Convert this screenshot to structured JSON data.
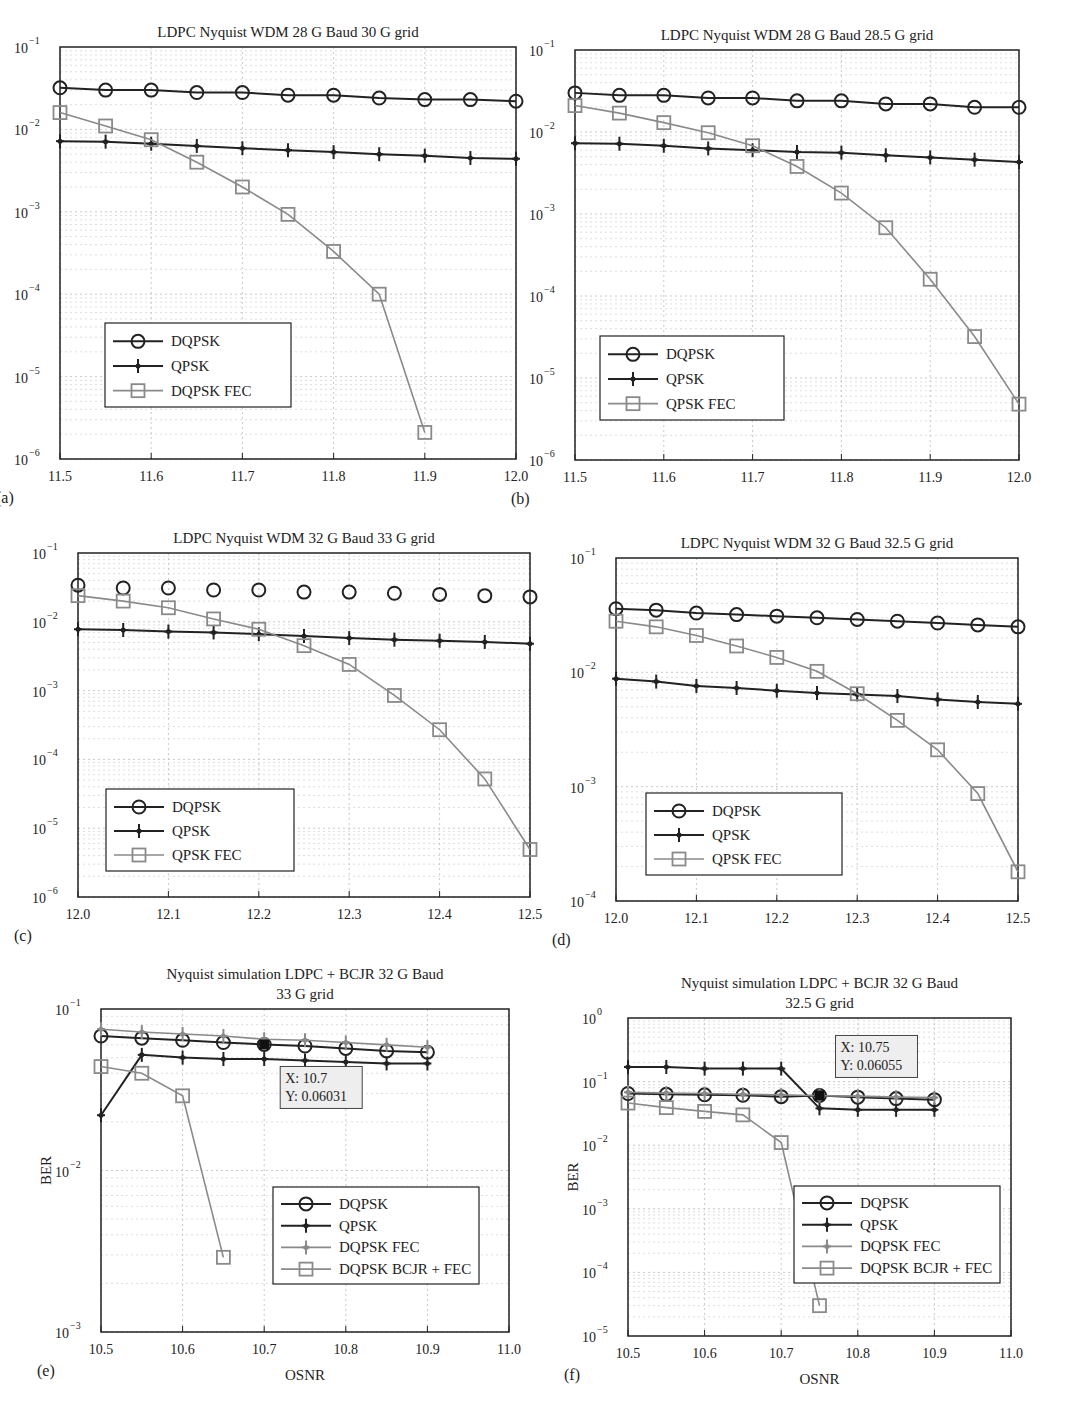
{
  "chart_data": [
    {
      "id": "a",
      "panel_label": "(a)",
      "type": "line",
      "title": "LDPC Nyquist WDM 28 G Baud 30 G grid",
      "title2": "",
      "xlabel": "",
      "ylabel": "",
      "yscale": "log",
      "xlim": [
        11.5,
        12.0
      ],
      "ylim_exp": [
        -6,
        -1
      ],
      "xticks": [
        "11.5",
        "11.6",
        "11.7",
        "11.8",
        "11.9",
        "12.0"
      ],
      "yticks": [
        {
          "base": "10",
          "exp": "−1"
        },
        {
          "base": "10",
          "exp": "−2"
        },
        {
          "base": "10",
          "exp": "−3"
        },
        {
          "base": "10",
          "exp": "−4"
        },
        {
          "base": "10",
          "exp": "−5"
        },
        {
          "base": "10",
          "exp": "−6"
        }
      ],
      "grid": true,
      "legend_position": "lower left",
      "series": [
        {
          "name": "DQPSK",
          "marker": "circle",
          "color": "#222222",
          "x": [
            11.5,
            11.55,
            11.6,
            11.65,
            11.7,
            11.75,
            11.8,
            11.85,
            11.9,
            11.95,
            12.0
          ],
          "values": [
            0.032,
            0.03,
            0.03,
            0.028,
            0.028,
            0.026,
            0.026,
            0.024,
            0.023,
            0.023,
            0.022
          ]
        },
        {
          "name": "QPSK",
          "marker": "star",
          "color": "#222222",
          "x": [
            11.5,
            11.55,
            11.6,
            11.65,
            11.7,
            11.75,
            11.8,
            11.85,
            11.9,
            11.95,
            12.0
          ],
          "values": [
            0.0072,
            0.0071,
            0.0067,
            0.0063,
            0.0059,
            0.0056,
            0.0053,
            0.005,
            0.0048,
            0.0045,
            0.0044
          ]
        },
        {
          "name": "DQPSK FEC",
          "marker": "square",
          "color": "#8a8a8a",
          "x": [
            11.5,
            11.55,
            11.6,
            11.65,
            11.7,
            11.75,
            11.8,
            11.85,
            11.9
          ],
          "values": [
            0.016,
            0.011,
            0.0075,
            0.004,
            0.002,
            0.00093,
            0.00033,
            0.0001,
            2.1e-06
          ]
        }
      ],
      "annotations": []
    },
    {
      "id": "b",
      "panel_label": "(b)",
      "type": "line",
      "title": "LDPC Nyquist WDM 28 G Baud 28.5 G grid",
      "title2": "",
      "xlabel": "",
      "ylabel": "",
      "yscale": "log",
      "xlim": [
        11.5,
        12.0
      ],
      "ylim_exp": [
        -6,
        -1
      ],
      "xticks": [
        "11.5",
        "11.6",
        "11.7",
        "11.8",
        "11.9",
        "12.0"
      ],
      "yticks": [
        {
          "base": "10",
          "exp": "−1"
        },
        {
          "base": "10",
          "exp": "−2"
        },
        {
          "base": "10",
          "exp": "−3"
        },
        {
          "base": "10",
          "exp": "−4"
        },
        {
          "base": "10",
          "exp": "−5"
        },
        {
          "base": "10",
          "exp": "−6"
        }
      ],
      "grid": true,
      "legend_position": "lower left",
      "series": [
        {
          "name": "DQPSK",
          "marker": "circle",
          "color": "#222222",
          "x": [
            11.5,
            11.55,
            11.6,
            11.65,
            11.7,
            11.75,
            11.8,
            11.85,
            11.9,
            11.95,
            12.0
          ],
          "values": [
            0.03,
            0.028,
            0.028,
            0.026,
            0.026,
            0.024,
            0.024,
            0.022,
            0.022,
            0.02,
            0.02
          ]
        },
        {
          "name": "QPSK",
          "marker": "star",
          "color": "#222222",
          "x": [
            11.5,
            11.55,
            11.6,
            11.65,
            11.7,
            11.75,
            11.8,
            11.85,
            11.9,
            11.95,
            12.0
          ],
          "values": [
            0.0073,
            0.0072,
            0.0068,
            0.0063,
            0.006,
            0.0057,
            0.0056,
            0.0052,
            0.0049,
            0.0046,
            0.0043
          ]
        },
        {
          "name": "QPSK FEC",
          "marker": "square",
          "color": "#8a8a8a",
          "x": [
            11.5,
            11.55,
            11.6,
            11.65,
            11.7,
            11.75,
            11.8,
            11.85,
            11.9,
            11.95,
            12.0
          ],
          "values": [
            0.021,
            0.017,
            0.013,
            0.0098,
            0.0068,
            0.0038,
            0.0018,
            0.00068,
            0.00016,
            3.2e-05,
            4.8e-06
          ]
        }
      ],
      "annotations": []
    },
    {
      "id": "c",
      "panel_label": "(c)",
      "type": "line",
      "title": "LDPC Nyquist WDM 32 G Baud 33 G grid",
      "title2": "",
      "xlabel": "",
      "ylabel": "",
      "yscale": "log",
      "xlim": [
        12.0,
        12.5
      ],
      "ylim_exp": [
        -6,
        -1
      ],
      "xticks": [
        "12.0",
        "12.1",
        "12.2",
        "12.3",
        "12.4",
        "12.5"
      ],
      "yticks": [
        {
          "base": "10",
          "exp": "−1"
        },
        {
          "base": "10",
          "exp": "−2"
        },
        {
          "base": "10",
          "exp": "−3"
        },
        {
          "base": "10",
          "exp": "−4"
        },
        {
          "base": "10",
          "exp": "−5"
        },
        {
          "base": "10",
          "exp": "−6"
        }
      ],
      "grid": true,
      "legend_position": "lower left",
      "series": [
        {
          "name": "DQPSK",
          "marker": "circle",
          "color": "#222222",
          "markers_only": true,
          "x": [
            12.0,
            12.05,
            12.1,
            12.15,
            12.2,
            12.25,
            12.3,
            12.35,
            12.4,
            12.45,
            12.5
          ],
          "values": [
            0.034,
            0.031,
            0.031,
            0.029,
            0.029,
            0.027,
            0.027,
            0.026,
            0.025,
            0.024,
            0.023
          ]
        },
        {
          "name": "QPSK",
          "marker": "star",
          "color": "#222222",
          "x": [
            12.0,
            12.05,
            12.1,
            12.15,
            12.2,
            12.25,
            12.3,
            12.35,
            12.4,
            12.45,
            12.5
          ],
          "values": [
            0.0078,
            0.0076,
            0.0072,
            0.007,
            0.0066,
            0.0062,
            0.0058,
            0.0055,
            0.0053,
            0.0051,
            0.0048
          ]
        },
        {
          "name": "QPSK FEC",
          "marker": "square",
          "color": "#8a8a8a",
          "x": [
            12.0,
            12.05,
            12.1,
            12.15,
            12.2,
            12.25,
            12.3,
            12.35,
            12.4,
            12.45,
            12.5
          ],
          "values": [
            0.024,
            0.02,
            0.016,
            0.011,
            0.0078,
            0.0045,
            0.0024,
            0.00085,
            0.00027,
            5.2e-05,
            4.9e-06
          ]
        }
      ],
      "annotations": []
    },
    {
      "id": "d",
      "panel_label": "(d)",
      "type": "line",
      "title": "LDPC Nyquist WDM 32 G Baud 32.5 G grid",
      "title2": "",
      "xlabel": "",
      "ylabel": "",
      "yscale": "log",
      "xlim": [
        12.0,
        12.5
      ],
      "ylim_exp": [
        -4,
        -1
      ],
      "xticks": [
        "12.0",
        "12.1",
        "12.2",
        "12.3",
        "12.4",
        "12.5"
      ],
      "yticks": [
        {
          "base": "10",
          "exp": "−1"
        },
        {
          "base": "10",
          "exp": "−2"
        },
        {
          "base": "10",
          "exp": "−3"
        },
        {
          "base": "10",
          "exp": "−4"
        }
      ],
      "grid": true,
      "legend_position": "lower left",
      "series": [
        {
          "name": "DQPSK",
          "marker": "circle",
          "color": "#222222",
          "x": [
            12.0,
            12.05,
            12.1,
            12.15,
            12.2,
            12.25,
            12.3,
            12.35,
            12.4,
            12.45,
            12.5
          ],
          "values": [
            0.036,
            0.035,
            0.033,
            0.032,
            0.031,
            0.03,
            0.029,
            0.028,
            0.027,
            0.026,
            0.025
          ]
        },
        {
          "name": "QPSK",
          "marker": "star",
          "color": "#222222",
          "x": [
            12.0,
            12.05,
            12.1,
            12.15,
            12.2,
            12.25,
            12.3,
            12.35,
            12.4,
            12.45,
            12.5
          ],
          "values": [
            0.0088,
            0.0083,
            0.0076,
            0.0073,
            0.0069,
            0.0066,
            0.0064,
            0.0062,
            0.0058,
            0.0055,
            0.0053
          ]
        },
        {
          "name": "QPSK FEC",
          "marker": "square",
          "color": "#8a8a8a",
          "x": [
            12.0,
            12.05,
            12.1,
            12.15,
            12.2,
            12.25,
            12.3,
            12.35,
            12.4,
            12.45,
            12.5
          ],
          "values": [
            0.028,
            0.025,
            0.021,
            0.017,
            0.0135,
            0.0102,
            0.0065,
            0.0038,
            0.0021,
            0.00087,
            0.00018
          ]
        }
      ],
      "annotations": []
    },
    {
      "id": "e",
      "panel_label": "(e)",
      "type": "line",
      "title": "Nyquist simulation LDPC + BCJR 32 G Baud",
      "title2": "33 G grid",
      "xlabel": "OSNR",
      "ylabel": "BER",
      "yscale": "log",
      "xlim": [
        10.5,
        11.0
      ],
      "ylim_exp": [
        -3,
        -1
      ],
      "xticks": [
        "10.5",
        "10.6",
        "10.7",
        "10.8",
        "10.9",
        "11.0"
      ],
      "yticks": [
        {
          "base": "10",
          "exp": "−1"
        },
        {
          "base": "10",
          "exp": "−2"
        },
        {
          "base": "10",
          "exp": "−3"
        }
      ],
      "grid": true,
      "legend_position": "lower right",
      "series": [
        {
          "name": "DQPSK",
          "marker": "circle",
          "color": "#222222",
          "x": [
            10.5,
            10.55,
            10.6,
            10.65,
            10.7,
            10.75,
            10.8,
            10.85,
            10.9
          ],
          "values": [
            0.068,
            0.066,
            0.064,
            0.062,
            0.0603,
            0.059,
            0.057,
            0.055,
            0.054
          ]
        },
        {
          "name": "QPSK",
          "marker": "star",
          "color": "#222222",
          "x": [
            10.5,
            10.55,
            10.6,
            10.65,
            10.7,
            10.75,
            10.8,
            10.85,
            10.9
          ],
          "values": [
            0.022,
            0.052,
            0.05,
            0.049,
            0.049,
            0.048,
            0.047,
            0.046,
            0.046
          ]
        },
        {
          "name": "DQPSK FEC",
          "marker": "star",
          "color": "#8a8a8a",
          "x": [
            10.5,
            10.55,
            10.6,
            10.65,
            10.7,
            10.75,
            10.8,
            10.85,
            10.9
          ],
          "values": [
            0.075,
            0.072,
            0.07,
            0.068,
            0.065,
            0.064,
            0.062,
            0.06,
            0.058
          ]
        },
        {
          "name": "DQPSK BCJR + FEC",
          "marker": "square",
          "color": "#8a8a8a",
          "x": [
            10.5,
            10.55,
            10.6,
            10.65
          ],
          "values": [
            0.044,
            0.04,
            0.029,
            0.0029
          ]
        }
      ],
      "annotations": [
        {
          "x": 10.7,
          "y": 0.06031,
          "line1": "X: 10.7",
          "line2": "Y: 0.06031"
        }
      ]
    },
    {
      "id": "f",
      "panel_label": "(f)",
      "type": "line",
      "title": "Nyquist simulation LDPC + BCJR 32 G Baud",
      "title2": "32.5 G grid",
      "xlabel": "OSNR",
      "ylabel": "BER",
      "yscale": "log",
      "xlim": [
        10.5,
        11.0
      ],
      "ylim_exp": [
        -5,
        0
      ],
      "xticks": [
        "10.5",
        "10.6",
        "10.7",
        "10.8",
        "10.9",
        "11.0"
      ],
      "yticks": [
        {
          "base": "10",
          "exp": "0"
        },
        {
          "base": "10",
          "exp": "−1"
        },
        {
          "base": "10",
          "exp": "−2"
        },
        {
          "base": "10",
          "exp": "−3"
        },
        {
          "base": "10",
          "exp": "−4"
        },
        {
          "base": "10",
          "exp": "−5"
        }
      ],
      "grid": true,
      "legend_position": "lower right",
      "series": [
        {
          "name": "DQPSK",
          "marker": "circle",
          "color": "#222222",
          "x": [
            10.5,
            10.55,
            10.6,
            10.65,
            10.7,
            10.75,
            10.8,
            10.85,
            10.9
          ],
          "values": [
            0.065,
            0.063,
            0.062,
            0.061,
            0.058,
            0.06055,
            0.057,
            0.054,
            0.052
          ]
        },
        {
          "name": "QPSK",
          "marker": "star",
          "color": "#222222",
          "x": [
            10.5,
            10.55,
            10.6,
            10.65,
            10.7,
            10.75,
            10.8,
            10.85,
            10.9
          ],
          "values": [
            0.17,
            0.17,
            0.16,
            0.16,
            0.16,
            0.038,
            0.036,
            0.036,
            0.036
          ]
        },
        {
          "name": "DQPSK FEC",
          "marker": "star",
          "color": "#8a8a8a",
          "x": [
            10.5,
            10.55,
            10.6,
            10.65,
            10.7,
            10.75,
            10.8,
            10.85,
            10.9
          ],
          "values": [
            0.068,
            0.066,
            0.065,
            0.063,
            0.062,
            0.06,
            0.059,
            0.057,
            0.056
          ]
        },
        {
          "name": "DQPSK BCJR + FEC",
          "marker": "square",
          "color": "#8a8a8a",
          "x": [
            10.5,
            10.55,
            10.6,
            10.65,
            10.7,
            10.75
          ],
          "values": [
            0.046,
            0.039,
            0.034,
            0.03,
            0.011,
            3e-05
          ]
        }
      ],
      "annotations": [
        {
          "x": 10.75,
          "y": 0.06055,
          "line1": "X: 10.75",
          "line2": "Y: 0.06055"
        }
      ]
    }
  ],
  "layout": [
    {
      "left": 60,
      "top": 47,
      "width": 456,
      "height": 412,
      "legend": {
        "x": 45,
        "y": 276,
        "w": 186,
        "h": 84
      }
    },
    {
      "left": 575,
      "top": 50,
      "width": 444,
      "height": 410,
      "legend": {
        "x": 25,
        "y": 286,
        "w": 184,
        "h": 84
      }
    },
    {
      "left": 78,
      "top": 553,
      "width": 452,
      "height": 344,
      "legend": {
        "x": 28,
        "y": 236,
        "w": 188,
        "h": 82
      }
    },
    {
      "left": 616,
      "top": 558,
      "width": 402,
      "height": 343,
      "legend": {
        "x": 30,
        "y": 235,
        "w": 196,
        "h": 82
      }
    },
    {
      "left": 101,
      "top": 1009,
      "width": 408,
      "height": 323,
      "legend": {
        "x": 172,
        "y": 178,
        "w": 206,
        "h": 97
      }
    },
    {
      "left": 628,
      "top": 1018,
      "width": 383,
      "height": 318,
      "legend": {
        "x": 166,
        "y": 168,
        "w": 206,
        "h": 97
      }
    }
  ]
}
